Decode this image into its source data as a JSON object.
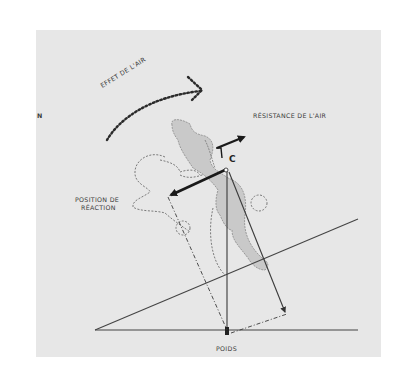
{
  "figure": {
    "type": "physics force diagram of a skier on a slope",
    "labels": {
      "effet_air": "EFFET DE L'AIR",
      "resistance_air": "RÉSISTANCE DE L'AIR",
      "position_reaction_line1": "POSITION DE",
      "position_reaction_line2": "RÉACTION",
      "poids": "POIDS",
      "center_point": "C",
      "edge_fragment": "N"
    },
    "colors": {
      "background": "#ffffff",
      "panel": "#e7e7e7",
      "skier_fill": "#c9c9c9",
      "line": "#3a3a3a",
      "arrow_heavy": "#1a1a1a"
    }
  }
}
